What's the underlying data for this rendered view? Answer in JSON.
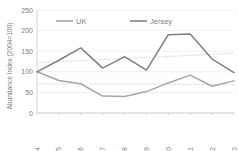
{
  "chart_data": {
    "type": "line",
    "title": "",
    "xlabel": "",
    "ylabel": "Abundance Index (2004=100)",
    "categories": [
      "2004",
      "2005",
      "2006",
      "2007",
      "2008",
      "2009",
      "2010",
      "2011",
      "2012",
      "2013"
    ],
    "ylim": [
      0,
      250
    ],
    "yticks": [
      0,
      50,
      100,
      150,
      200,
      250
    ],
    "ytick_labels": [
      "0",
      "50",
      "100",
      "150",
      "200",
      "250"
    ],
    "grid": true,
    "legend_position": "top",
    "series": [
      {
        "name": "UK",
        "color": "#a6a6a6",
        "values": [
          100,
          79,
          71,
          41,
          40,
          52,
          73,
          92,
          65,
          78
        ],
        "trendline": {
          "name": "UK trend",
          "color": "#bfbfbf",
          "start": 71,
          "end": 69,
          "style": "dotted"
        }
      },
      {
        "name": "Jersey",
        "color": "#808080",
        "values": [
          100,
          128,
          158,
          109,
          137,
          104,
          190,
          192,
          131,
          98
        ],
        "trendline": {
          "name": "Jersey trend",
          "color": "#bfbfbf",
          "start": 122,
          "end": 145,
          "style": "dotted"
        }
      }
    ]
  },
  "legend": {
    "items": [
      {
        "label": "UK",
        "color": "#a6a6a6"
      },
      {
        "label": "Jersey",
        "color": "#808080"
      }
    ]
  },
  "axis": {
    "y_title": "Abundance Index (2004=100)"
  }
}
